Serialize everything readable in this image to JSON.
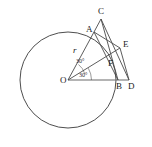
{
  "figure": {
    "width": 152,
    "height": 147,
    "background_color": "#ffffff",
    "stroke_color": "#3a3a3a"
  },
  "circle": {
    "name": "main-circle",
    "center_x": 68,
    "center_y": 80,
    "radius": 48
  },
  "points": [
    {
      "id": "O",
      "label": "O",
      "x": 68,
      "y": 80,
      "label_x": 60,
      "label_y": 83,
      "on_circle": false,
      "role": "circle-center"
    },
    {
      "id": "A",
      "label": "A",
      "x": 94,
      "y": 32,
      "label_x": 86,
      "label_y": 32,
      "on_circle": true,
      "role": "vertex"
    },
    {
      "id": "C",
      "label": "C",
      "x": 101,
      "y": 19,
      "label_x": 98,
      "label_y": 14,
      "on_circle": false,
      "role": "apex"
    },
    {
      "id": "E",
      "label": "E",
      "x": 120,
      "y": 48,
      "label_x": 123,
      "label_y": 47,
      "on_circle": false,
      "role": "vertex"
    },
    {
      "id": "F",
      "label": "F",
      "x": 110,
      "y": 60,
      "label_x": 108,
      "label_y": 66,
      "on_circle": false,
      "role": "intersection"
    },
    {
      "id": "B",
      "label": "B",
      "x": 118,
      "y": 80,
      "label_x": 116,
      "label_y": 89,
      "on_circle": false,
      "role": "base-point"
    },
    {
      "id": "D",
      "label": "D",
      "x": 129,
      "y": 80,
      "label_x": 128,
      "label_y": 89,
      "on_circle": false,
      "role": "base-point"
    }
  ],
  "segments": [
    {
      "name": "segment-O-A",
      "from": "O",
      "to": "A",
      "style": "line"
    },
    {
      "name": "segment-O-E",
      "from": "O",
      "to": "E",
      "style": "line"
    },
    {
      "name": "segment-O-D",
      "from": "O",
      "to": "D",
      "style": "baseline"
    },
    {
      "name": "segment-A-C",
      "from": "A",
      "to": "C",
      "style": "line"
    },
    {
      "name": "segment-A-B",
      "from": "A",
      "to": "B",
      "style": "line"
    },
    {
      "name": "segment-A-E",
      "from": "A",
      "to": "E",
      "style": "line"
    },
    {
      "name": "segment-C-B",
      "from": "C",
      "to": "B",
      "style": "line"
    },
    {
      "name": "segment-C-D",
      "from": "C",
      "to": "D",
      "style": "line"
    },
    {
      "name": "segment-E-D",
      "from": "E",
      "to": "D",
      "style": "line"
    }
  ],
  "measurements": {
    "radius_label": "r",
    "radius_label_x": 73,
    "radius_label_y": 53,
    "angles": [
      {
        "name": "angle-upper",
        "text": "30°",
        "x": 76,
        "y": 63
      },
      {
        "name": "angle-lower",
        "text": "30°",
        "x": 79,
        "y": 77
      }
    ]
  }
}
